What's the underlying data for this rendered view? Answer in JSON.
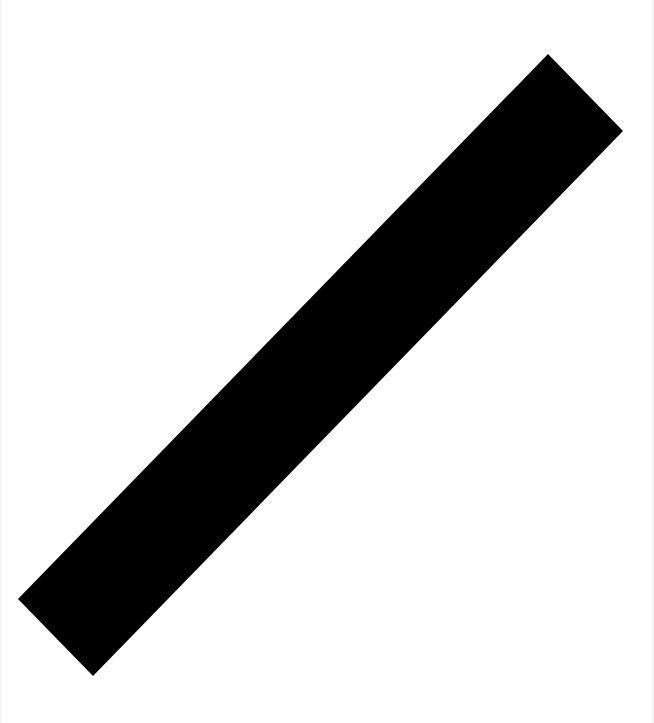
{
  "image": {
    "background_color": "#ffffff",
    "shape": {
      "type": "rotated-bar",
      "fill_color": "#000000",
      "corners": [
        [
          548,
          54
        ],
        [
          623,
          131
        ],
        [
          93,
          676
        ],
        [
          18,
          599
        ]
      ]
    }
  }
}
